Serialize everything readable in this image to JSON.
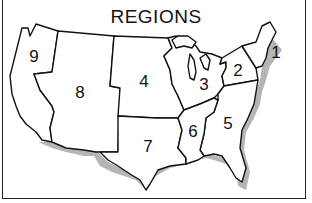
{
  "map": {
    "title": "REGIONS",
    "subject": "Contiguous United States divided into numbered regions",
    "regions": [
      {
        "id": "1",
        "label": "1",
        "area": "New England"
      },
      {
        "id": "2",
        "label": "2",
        "area": "Mid-Atlantic"
      },
      {
        "id": "3",
        "label": "3",
        "area": "Great Lakes"
      },
      {
        "id": "4",
        "label": "4",
        "area": "Plains"
      },
      {
        "id": "5",
        "label": "5",
        "area": "Southeast"
      },
      {
        "id": "6",
        "label": "6",
        "area": "South Central"
      },
      {
        "id": "7",
        "label": "7",
        "area": "Southwest"
      },
      {
        "id": "8",
        "label": "8",
        "area": "Mountain"
      },
      {
        "id": "9",
        "label": "9",
        "area": "Pacific"
      }
    ],
    "colors": {
      "outline": "#111111",
      "fill": "#ffffff",
      "coast_shadow": "#b5b5b5",
      "background": "#ffffff"
    }
  }
}
